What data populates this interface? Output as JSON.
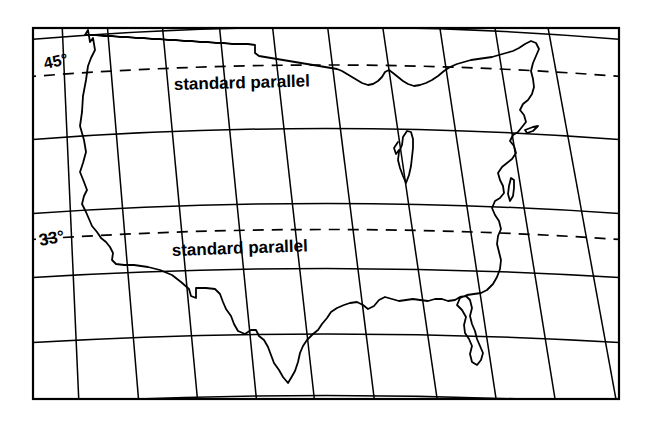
{
  "figure": {
    "kind": "map",
    "background_color": "#ffffff",
    "line_color": "#000000"
  },
  "frame": {
    "name": "map-border",
    "x": 33,
    "y": 28,
    "width": 586,
    "height": 371,
    "stroke_width": 2.2
  },
  "labels": {
    "parallel_45_degrees": "45°",
    "parallel_33_degrees": "33°",
    "standard_parallel_upper": "standard parallel",
    "standard_parallel_lower": "standard parallel"
  },
  "graticule": {
    "description": "Conic graticule: straight converging meridians and concentric circular parallels",
    "meridian_count": 11,
    "parallel_count": 6,
    "stroke_width": 1.5,
    "projection_center_x": 326,
    "projection_apex_y": -1105,
    "meridians": [
      {
        "name": "meridian-1",
        "top_x": 33,
        "bottom_x": 33
      },
      {
        "name": "meridian-2",
        "top_x": 63,
        "bottom_x": 79
      },
      {
        "name": "meridian-3",
        "top_x": 108,
        "bottom_x": 138
      },
      {
        "name": "meridian-4",
        "top_x": 163,
        "bottom_x": 197
      },
      {
        "name": "meridian-5",
        "top_x": 220,
        "bottom_x": 256
      },
      {
        "name": "meridian-6",
        "top_x": 273,
        "bottom_x": 315
      },
      {
        "name": "meridian-7",
        "top_x": 328,
        "bottom_x": 375
      },
      {
        "name": "meridian-8",
        "top_x": 383,
        "bottom_x": 438
      },
      {
        "name": "meridian-9",
        "top_x": 440,
        "bottom_x": 497
      },
      {
        "name": "meridian-10",
        "top_x": 495,
        "bottom_x": 556
      },
      {
        "name": "meridian-11",
        "top_x": 548,
        "bottom_x": 617
      }
    ],
    "parallels_solid": [
      {
        "name": "parallel-solid-1",
        "left_edge_y": 40,
        "center_y": 28,
        "radius": 1133
      },
      {
        "name": "parallel-solid-2",
        "left_edge_y": 140,
        "center_y": 104,
        "radius": 1209
      },
      {
        "name": "parallel-solid-3",
        "left_edge_y": 214,
        "center_y": 176,
        "radius": 1281
      },
      {
        "name": "parallel-solid-4",
        "left_edge_y": 278,
        "center_y": 248,
        "radius": 1353
      },
      {
        "name": "parallel-solid-5",
        "left_edge_y": 343,
        "center_y": 318,
        "radius": 1423
      },
      {
        "name": "parallel-solid-6",
        "left_edge_y": 399,
        "center_y": 386,
        "radius": 1491
      }
    ],
    "parallels_dashed": [
      {
        "name": "standard-parallel-45",
        "degrees": 45,
        "left_edge_y": 77,
        "center_y": 50,
        "radius": 1155,
        "dash": "11 8"
      },
      {
        "name": "standard-parallel-33",
        "degrees": 33,
        "left_edge_y": 240,
        "center_y": 208,
        "radius": 1313,
        "dash": "11 8"
      }
    ]
  },
  "label_positions": {
    "deg45": {
      "x": 45,
      "y": 69,
      "rotate": -12,
      "font_size": 16
    },
    "deg33": {
      "x": 40,
      "y": 246,
      "rotate": -10,
      "font_size": 17
    },
    "sp_upper": {
      "x": 174,
      "y": 90,
      "rotate": -1.5,
      "font_size": 17
    },
    "sp_lower": {
      "x": 172,
      "y": 256,
      "rotate": -2.0,
      "font_size": 17
    }
  },
  "coastline": {
    "name": "usa-outline",
    "stroke_width": 1.8,
    "description": "Outline of the contiguous United States including the Great Lakes, Florida peninsula, Gulf and Atlantic coasts"
  }
}
